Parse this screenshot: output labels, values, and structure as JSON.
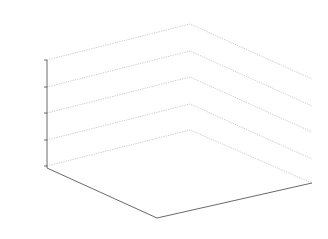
{
  "chart_data": {
    "type": "surface3d",
    "xlabel": "m",
    "ylabel": "n",
    "zlabel": "Cost Time (ms)",
    "x_ticks": [
      "20",
      "30",
      "40",
      "50"
    ],
    "y_ticks": [
      "0",
      "5",
      "10",
      "15",
      "20"
    ],
    "z_ticks": [
      "0",
      "1000",
      "2000",
      "3000",
      "4000"
    ],
    "xlim": [
      20,
      50
    ],
    "ylim": [
      0,
      20
    ],
    "zlim": [
      0,
      4000
    ],
    "grid": true,
    "x": [
      20,
      25,
      30,
      35,
      40,
      45,
      50
    ],
    "y": [
      0,
      2.5,
      5,
      7.5,
      10,
      12.5,
      15,
      17.5,
      20
    ],
    "peaks": [
      {
        "m": 25,
        "n": 17.5,
        "value": 3300
      },
      {
        "m": 30,
        "n": 17.5,
        "value": 3900
      }
    ]
  },
  "colors": {
    "surface": "#5a5a5a",
    "grid_lines": "#bdbdbd",
    "vertex": "#111111"
  }
}
